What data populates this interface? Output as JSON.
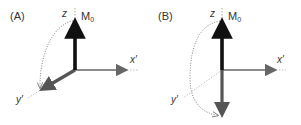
{
  "figure": {
    "panels": [
      {
        "id": "A",
        "label": "(A)",
        "axes": {
          "z": "z",
          "x": "x′",
          "y": "y′"
        },
        "vector": {
          "label": "M",
          "subscript": "0",
          "state": "along +z (equilibrium) with rotated component along y′"
        },
        "rotation": "90° pulse: magnetization tipped from z into y′"
      },
      {
        "id": "B",
        "label": "(B)",
        "axes": {
          "z": "z",
          "x": "x′",
          "y": "y′"
        },
        "vector": {
          "label": "M",
          "subscript": "0",
          "state": "along +z (equilibrium) with inverted component along −z"
        },
        "rotation": "180° pulse: magnetization inverted from +z to −z"
      }
    ],
    "colors": {
      "m0_vector": "#111111",
      "rotated_vector": "#555555",
      "axes": "#666666",
      "dotted_path": "#777777",
      "text": "#333333"
    }
  }
}
